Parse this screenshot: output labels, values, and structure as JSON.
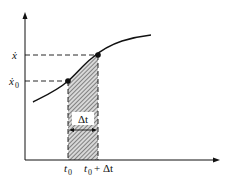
{
  "diagram": {
    "title": "",
    "y_axis_labels": {
      "x_dot": "ẋ",
      "x_dot_0_main": "ẋ",
      "x_dot_0_sub": "0"
    },
    "x_axis_labels": {
      "t0_main": "t",
      "t0_sub": "0",
      "t0_plus_main": "t",
      "t0_plus_sub": "0",
      "t0_plus_op": "+",
      "t0_plus_delta": "Δt"
    },
    "interval_label": "Δt",
    "points": [
      {
        "name": "start-point",
        "x": 68,
        "y": 81
      },
      {
        "name": "end-point",
        "x": 98,
        "y": 55
      }
    ],
    "colors": {
      "line": "#111111",
      "hatch": "#555555",
      "background": "#ffffff"
    }
  }
}
